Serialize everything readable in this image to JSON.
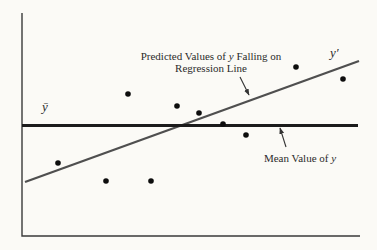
{
  "figure": {
    "background": "#fbfaf6",
    "axis_color": "#3a3a3a",
    "regression_line_color": "#4f4f4f",
    "mean_line_color": "#1b1b1b",
    "dot_color": "#0d0d0d",
    "arrow_color": "#333333",
    "text_color": "#2b2b2b"
  },
  "labels": {
    "y_bar": "ȳ",
    "y_prime": "y′",
    "regression_annotation": {
      "line1_pre": "Predicted Values of ",
      "y_symbol": "y",
      "line1_post": " Falling on",
      "line2": "Regression Line"
    },
    "mean_annotation": {
      "pre": "Mean Value of ",
      "y_symbol": "y"
    }
  },
  "chart_data": {
    "type": "scatter",
    "title": "",
    "xlabel": "",
    "ylabel": "",
    "legend": "none",
    "axes_note": "no tick marks or numeric scales shown; arbitrary 0-10 unit estimates",
    "x_range_units": [
      0,
      10
    ],
    "y_range_units": [
      0,
      10
    ],
    "points_units": [
      [
        1.1,
        3.3
      ],
      [
        2.5,
        2.5
      ],
      [
        3.1,
        6.4
      ],
      [
        3.8,
        2.5
      ],
      [
        4.6,
        5.8
      ],
      [
        5.2,
        5.5
      ],
      [
        6.0,
        5.0
      ],
      [
        6.6,
        4.5
      ],
      [
        8.1,
        7.6
      ],
      [
        9.5,
        7.0
      ]
    ],
    "mean_line_y_units": 5.0,
    "regression_line_units": {
      "from": [
        0.1,
        2.4
      ],
      "to": [
        10.0,
        7.8
      ]
    },
    "pixel_layout": {
      "plot": {
        "x0": 22,
        "y0": 13,
        "x1": 360,
        "y1": 236
      },
      "points_px": [
        [
          58,
          163
        ],
        [
          106,
          181
        ],
        [
          128,
          94
        ],
        [
          151,
          181
        ],
        [
          177,
          106
        ],
        [
          199,
          113
        ],
        [
          223,
          124
        ],
        [
          246,
          135
        ],
        [
          296,
          67
        ],
        [
          343,
          79
        ]
      ],
      "dot_radius": 2.8,
      "mean_line_px": {
        "x0": 22,
        "y": 125.5,
        "x1": 358,
        "width": 3
      },
      "regression_line_px": {
        "x0": 25,
        "y0": 182,
        "x1": 359,
        "y1": 61,
        "width": 2.3
      },
      "axis_width": 1.4,
      "arrows_px": [
        {
          "from": [
            240,
            77
          ],
          "to": [
            249,
            95
          ]
        },
        {
          "from": [
            286,
            147
          ],
          "to": [
            280,
            128
          ]
        }
      ]
    }
  }
}
